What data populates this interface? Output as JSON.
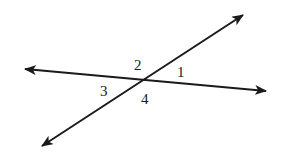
{
  "diagram": {
    "type": "intersecting-lines",
    "colors": {
      "stroke": "#1a1a1a",
      "background": "#ffffff"
    },
    "intersection": {
      "x": 145,
      "y": 79
    },
    "lines": [
      {
        "name": "horizontal-line",
        "start": {
          "x": 25,
          "y": 69
        },
        "end": {
          "x": 266,
          "y": 91
        },
        "arrows": [
          "start",
          "end"
        ]
      },
      {
        "name": "diagonal-line",
        "start": {
          "x": 42,
          "y": 146
        },
        "end": {
          "x": 243,
          "y": 15
        },
        "arrows": [
          "start",
          "end"
        ]
      }
    ],
    "angle_labels": [
      {
        "id": "angle-1",
        "text": "1",
        "x": 177,
        "y": 77
      },
      {
        "id": "angle-2",
        "text": "2",
        "x": 134,
        "y": 70
      },
      {
        "id": "angle-3",
        "text": "3",
        "x": 100,
        "y": 96
      },
      {
        "id": "angle-4",
        "text": "4",
        "x": 141,
        "y": 104
      }
    ]
  }
}
